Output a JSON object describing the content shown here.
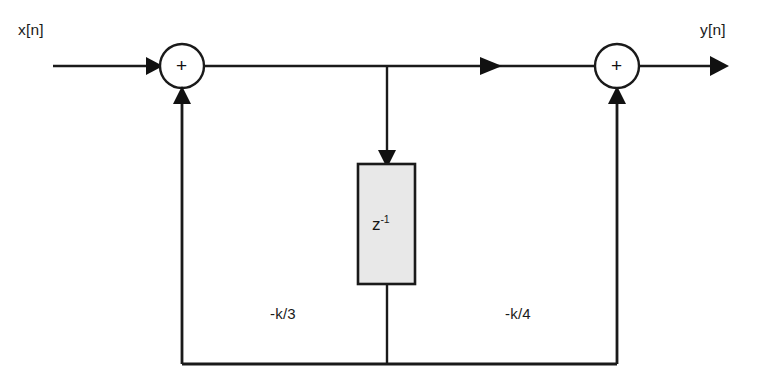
{
  "diagram": {
    "type": "signal-flow-block-diagram",
    "background_color": "#ffffff",
    "line_color": "#1a1a1a",
    "block_fill_color": "#e8e8e8",
    "input_label": "x[n]",
    "output_label": "y[n]",
    "summer_symbol_left": "+",
    "summer_symbol_right": "+",
    "delay_base": "z",
    "delay_exponent": "-1",
    "coefficient_left": "-k/3",
    "coefficient_right": "-k/4",
    "top_cut_text": ""
  }
}
